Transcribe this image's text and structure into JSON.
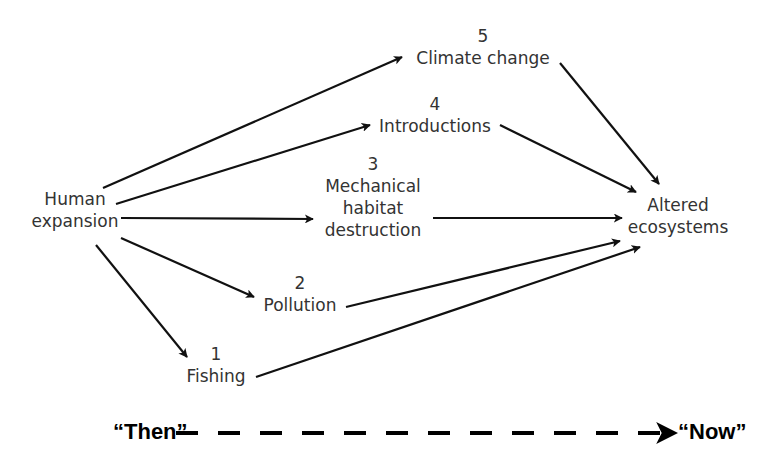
{
  "diagram": {
    "source_node": {
      "line1": "Human",
      "line2": "expansion"
    },
    "intermediate_nodes": [
      {
        "number": "5",
        "label": "Climate change"
      },
      {
        "number": "4",
        "label": "Introductions"
      },
      {
        "number": "3",
        "line1": "Mechanical",
        "line2": "habitat",
        "line3": "destruction"
      },
      {
        "number": "2",
        "label": "Pollution"
      },
      {
        "number": "1",
        "label": "Fishing"
      }
    ],
    "target_node": {
      "line1": "Altered",
      "line2": "ecosystems"
    },
    "edges": [
      {
        "from": "Human expansion",
        "to": "Climate change"
      },
      {
        "from": "Human expansion",
        "to": "Introductions"
      },
      {
        "from": "Human expansion",
        "to": "Mechanical habitat destruction"
      },
      {
        "from": "Human expansion",
        "to": "Pollution"
      },
      {
        "from": "Human expansion",
        "to": "Fishing"
      },
      {
        "from": "Climate change",
        "to": "Altered ecosystems"
      },
      {
        "from": "Introductions",
        "to": "Altered ecosystems"
      },
      {
        "from": "Mechanical habitat destruction",
        "to": "Altered ecosystems"
      },
      {
        "from": "Pollution",
        "to": "Altered ecosystems"
      },
      {
        "from": "Fishing",
        "to": "Altered ecosystems"
      }
    ],
    "timeline": {
      "start_label": "“Then”",
      "end_label": "“Now”"
    },
    "colors": {
      "text": "#333333",
      "arrow": "#111111",
      "timeline": "#000000"
    }
  }
}
